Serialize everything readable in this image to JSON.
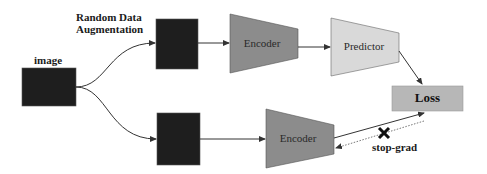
{
  "diagram": {
    "labels": {
      "augmentation_line1": "Random Data",
      "augmentation_line2": "Augmentation",
      "image": "image",
      "stop_grad": "stop-grad"
    },
    "nodes": {
      "input_image": {
        "label": "image",
        "fill": "#1e1e1e"
      },
      "view_top": {
        "fill": "#1e1e1e"
      },
      "view_bottom": {
        "fill": "#1e1e1e"
      },
      "encoder_top": {
        "label": "Encoder",
        "fill": "#8c8c8c"
      },
      "predictor": {
        "label": "Predictor",
        "fill": "#d9d9d9"
      },
      "encoder_bottom": {
        "label": "Encoder",
        "fill": "#8c8c8c"
      },
      "loss": {
        "label": "Loss",
        "fill": "#b7b7b7"
      }
    },
    "edges": [
      {
        "from": "input_image",
        "to": "view_top",
        "style": "solid"
      },
      {
        "from": "input_image",
        "to": "view_bottom",
        "style": "solid"
      },
      {
        "from": "view_top",
        "to": "encoder_top",
        "style": "solid"
      },
      {
        "from": "encoder_top",
        "to": "predictor",
        "style": "solid"
      },
      {
        "from": "predictor",
        "to": "loss",
        "style": "solid"
      },
      {
        "from": "view_bottom",
        "to": "encoder_bottom",
        "style": "solid"
      },
      {
        "from": "encoder_bottom",
        "to": "loss",
        "style": "solid"
      },
      {
        "from": "loss",
        "to": "encoder_bottom",
        "style": "dotted",
        "blocked": true,
        "label": "stop-grad"
      }
    ],
    "colors": {
      "line": "#333333",
      "dotted_line": "#777777",
      "stop_marker": "#111111"
    }
  }
}
